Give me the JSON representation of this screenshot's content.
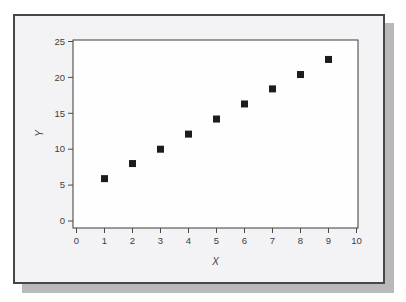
{
  "window": {
    "background_color": "#ffffff",
    "panel_fill": "#f3f3f5",
    "panel_border_color": "#474747",
    "panel_shadow_color": "#b9b9b9"
  },
  "chart_data": {
    "type": "scatter",
    "title": "",
    "xlabel": "X",
    "ylabel": "Y",
    "xlim": [
      0,
      10
    ],
    "ylim": [
      0,
      25
    ],
    "x_ticks": [
      0,
      1,
      2,
      3,
      4,
      5,
      6,
      7,
      8,
      9,
      10
    ],
    "y_ticks": [
      0,
      5,
      10,
      15,
      20,
      25
    ],
    "grid": false,
    "legend": "none",
    "plot_background": "#fefefe",
    "frame_color": "#3a3a3a",
    "tick_color": "#4a4a4a",
    "tick_label_color": "#3d3d3d",
    "marker": {
      "shape": "square",
      "color": "#1c1c1c",
      "size_px": 7
    },
    "series": [
      {
        "name": "Y vs X",
        "x": [
          1,
          2,
          3,
          4,
          5,
          6,
          7,
          8,
          9
        ],
        "y": [
          5.9,
          8.0,
          10.0,
          12.1,
          14.2,
          16.3,
          18.4,
          20.4,
          22.5
        ]
      }
    ]
  }
}
